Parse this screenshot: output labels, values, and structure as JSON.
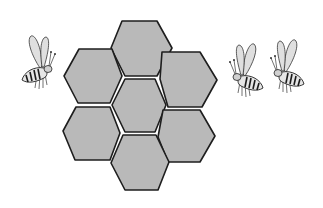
{
  "image": {
    "title": "Honeycomb with bees",
    "description": "Seven grey hexagonal honeycomb cells arranged in a flower pattern, with one bee on the left and two bees on the right"
  },
  "honeycomb": {
    "cell_count": 7,
    "fill_color": "#b9b9b9",
    "stroke_color": "#1e1e1e",
    "cells": [
      {
        "name": "top",
        "points": "122,21 157,21 172,48 157,76 125,76 111,48"
      },
      {
        "name": "upper-left",
        "points": "79,49 112,49 122,76 110,103 78,103 64,76"
      },
      {
        "name": "upper-right",
        "points": "162,52 200,52 217,80 202,107 168,107 160,79"
      },
      {
        "name": "center",
        "points": "125,79 155,79 166,105 155,132 125,132 112,105"
      },
      {
        "name": "lower-left",
        "points": "76,107 110,107 120,133 110,160 75,160 63,131"
      },
      {
        "name": "lower-right",
        "points": "163,110 200,110 215,136 200,162 168,162 158,137"
      },
      {
        "name": "bottom",
        "points": "123,135 156,135 169,162 158,190 125,190 111,163"
      }
    ]
  },
  "bees": [
    {
      "name": "bee-left",
      "x": 40,
      "y": 70,
      "facing": "right"
    },
    {
      "name": "bee-right-1",
      "x": 245,
      "y": 78,
      "facing": "left"
    },
    {
      "name": "bee-right-2",
      "x": 286,
      "y": 74,
      "facing": "left"
    }
  ]
}
